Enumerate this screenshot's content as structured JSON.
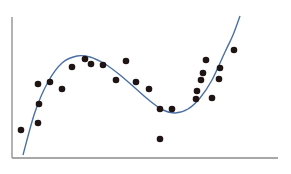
{
  "chart_data": {
    "type": "scatter",
    "title": "",
    "xlabel": "",
    "ylabel": "",
    "grid": false,
    "legend": null,
    "axes": {
      "y_axis": {
        "x": 12,
        "y1": 17,
        "y2": 158,
        "color": "#8a8a8a"
      },
      "x_axis": {
        "y": 158,
        "x1": 12,
        "x2": 278,
        "color": "#8a8a8a"
      }
    },
    "fit_curve": {
      "type": "cubic",
      "color": "#4a6fa5",
      "points": [
        [
          23,
          155
        ],
        [
          35,
          112
        ],
        [
          48,
          82
        ],
        [
          62,
          63
        ],
        [
          77,
          56
        ],
        [
          90,
          57
        ],
        [
          105,
          64
        ],
        [
          120,
          75
        ],
        [
          135,
          88
        ],
        [
          150,
          101
        ],
        [
          163,
          110
        ],
        [
          175,
          113
        ],
        [
          188,
          109
        ],
        [
          200,
          98
        ],
        [
          212,
          80
        ],
        [
          225,
          52
        ],
        [
          233,
          35
        ],
        [
          240,
          16
        ]
      ]
    },
    "points": [
      [
        21,
        130
      ],
      [
        38,
        123
      ],
      [
        39,
        104
      ],
      [
        38,
        84
      ],
      [
        50,
        82
      ],
      [
        62,
        89
      ],
      [
        72,
        67
      ],
      [
        85,
        59
      ],
      [
        91,
        64
      ],
      [
        103,
        65
      ],
      [
        116,
        80
      ],
      [
        126,
        61
      ],
      [
        136,
        82
      ],
      [
        149,
        89
      ],
      [
        160,
        109
      ],
      [
        172,
        109
      ],
      [
        160,
        139
      ],
      [
        196,
        99
      ],
      [
        197,
        91
      ],
      [
        201,
        80
      ],
      [
        203,
        73
      ],
      [
        206,
        60
      ],
      [
        212,
        98
      ],
      [
        219,
        79
      ],
      [
        220,
        68
      ],
      [
        234,
        50
      ]
    ],
    "point_color": "#1f1414",
    "point_radius": 3.3
  }
}
